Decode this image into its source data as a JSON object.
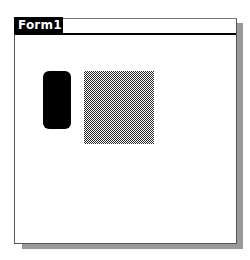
{
  "window": {
    "title": "Form1",
    "colors": {
      "title_tab_bg": "#000000",
      "title_tab_fg": "#ffffff",
      "shadow": "#9a9a9a",
      "background": "#ffffff"
    }
  },
  "shapes": [
    {
      "kind": "rounded-rectangle",
      "fill": "solid-black"
    },
    {
      "kind": "rectangle",
      "fill": "gray-checkered-pattern"
    }
  ]
}
